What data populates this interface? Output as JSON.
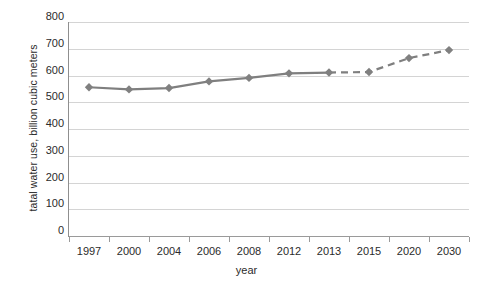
{
  "chart_data": {
    "type": "line",
    "title": "",
    "xlabel": "year",
    "ylabel": "tatal water use, billion cubic meters",
    "categories": [
      "1997",
      "2000",
      "2004",
      "2006",
      "2008",
      "2012",
      "2013",
      "2015",
      "2020",
      "2030"
    ],
    "values": [
      556,
      548,
      553,
      578,
      591,
      608,
      611,
      613,
      665,
      695
    ],
    "series": [
      {
        "name": "total water use",
        "categories": [
          "1997",
          "2000",
          "2004",
          "2006",
          "2008",
          "2012",
          "2013",
          "2015",
          "2020",
          "2030"
        ],
        "values": [
          556,
          548,
          553,
          578,
          591,
          608,
          611,
          613,
          665,
          695
        ]
      }
    ],
    "segments": [
      {
        "name": "historical",
        "style": "solid",
        "from": "1997",
        "to": "2013"
      },
      {
        "name": "projection",
        "style": "dashed",
        "from": "2013",
        "to": "2030"
      }
    ],
    "ylim": [
      0,
      800
    ],
    "ytick_step": 100,
    "yticks": [
      "800",
      "700",
      "600",
      "500",
      "400",
      "300",
      "200",
      "100",
      "0"
    ],
    "ytick_values": [
      800,
      700,
      600,
      500,
      400,
      300,
      200,
      100,
      0
    ],
    "grid": true,
    "grid_axis": "y",
    "legend": "none",
    "marker": "diamond",
    "colors": {
      "series_line": "#7f7f7f",
      "marker": "#808080",
      "gridline": "#d4d4d4",
      "axis": "#8f8f8f",
      "text": "#2b2b2b",
      "background": "#ffffff"
    }
  }
}
